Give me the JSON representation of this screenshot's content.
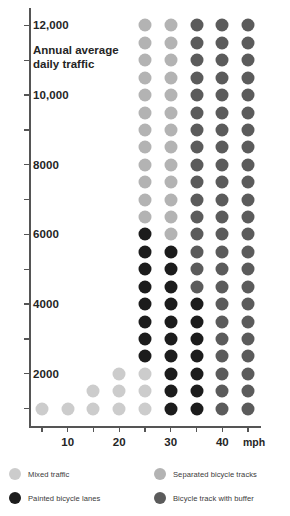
{
  "axis_title": "Annual average daily traffic",
  "x_unit_label": "mph",
  "y_axis": {
    "label": "Annual average daily traffic",
    "tick_values": [
      1000,
      2000,
      3000,
      4000,
      5000,
      6000,
      7000,
      8000,
      9000,
      10000,
      11000,
      12000
    ],
    "labeled_ticks": [
      {
        "value": 12000,
        "text": "12,000"
      },
      {
        "value": 10000,
        "text": "10,000"
      },
      {
        "value": 8000,
        "text": "8000"
      },
      {
        "value": 6000,
        "text": "6000"
      },
      {
        "value": 4000,
        "text": "4000"
      },
      {
        "value": 2000,
        "text": "2000"
      }
    ],
    "range": [
      500,
      12500
    ]
  },
  "x_axis": {
    "tick_values": [
      5,
      10,
      15,
      20,
      25,
      30,
      35,
      40,
      45
    ],
    "labeled_ticks": [
      {
        "value": 10,
        "text": "10"
      },
      {
        "value": 20,
        "text": "20"
      },
      {
        "value": 30,
        "text": "30"
      },
      {
        "value": 40,
        "text": "40"
      }
    ],
    "range": [
      2.5,
      47.5
    ]
  },
  "colors": {
    "mixed_traffic": "#cccccc",
    "separated_bicycle_tracks": "#b3b3b3",
    "bicycle_track_with_buffer": "#5b5b5b",
    "painted_bicycle_lanes": "#1c1c1c",
    "axis": "#555555",
    "text": "#252525"
  },
  "legend": {
    "items": [
      {
        "key": "mixed_traffic",
        "label": "Mixed traffic",
        "color": "#cccccc"
      },
      {
        "key": "painted_bicycle_lanes",
        "label": "Painted bicycle lanes",
        "color": "#1c1c1c"
      },
      {
        "key": "separated_bicycle_tracks",
        "label": "Separated bicycle tracks",
        "color": "#b3b3b3"
      },
      {
        "key": "bicycle_track_with_buffer",
        "label": "Bicycle track with buffer",
        "color": "#5b5b5b"
      }
    ]
  },
  "chart_data": {
    "type": "heatmap",
    "title": "Annual average daily traffic",
    "xlabel": "mph",
    "ylabel": "Annual average daily traffic",
    "xlim": [
      2.5,
      47.5
    ],
    "ylim": [
      500,
      12500
    ],
    "grid": false,
    "legend_position": "bottom",
    "x_categories": [
      5,
      10,
      15,
      20,
      25,
      30,
      35,
      40,
      45
    ],
    "y_categories": [
      1000,
      1500,
      2000,
      2500,
      3000,
      3500,
      4000,
      4500,
      5000,
      5500,
      6000,
      6500,
      7000,
      7500,
      8000,
      8500,
      9000,
      9500,
      10000,
      10500,
      11000,
      11500,
      12000
    ],
    "category_legend": [
      "mixed_traffic",
      "separated_bicycle_tracks",
      "bicycle_track_with_buffer",
      "painted_bicycle_lanes"
    ],
    "cells": [
      {
        "y": 12000,
        "row": [
          null,
          null,
          null,
          null,
          "separated_bicycle_tracks",
          "separated_bicycle_tracks",
          "bicycle_track_with_buffer",
          "bicycle_track_with_buffer",
          "bicycle_track_with_buffer"
        ]
      },
      {
        "y": 11500,
        "row": [
          null,
          null,
          null,
          null,
          "separated_bicycle_tracks",
          "separated_bicycle_tracks",
          "bicycle_track_with_buffer",
          "bicycle_track_with_buffer",
          "bicycle_track_with_buffer"
        ]
      },
      {
        "y": 11000,
        "row": [
          null,
          null,
          null,
          null,
          "separated_bicycle_tracks",
          "separated_bicycle_tracks",
          "bicycle_track_with_buffer",
          "bicycle_track_with_buffer",
          "bicycle_track_with_buffer"
        ]
      },
      {
        "y": 10500,
        "row": [
          null,
          null,
          null,
          null,
          "separated_bicycle_tracks",
          "separated_bicycle_tracks",
          "bicycle_track_with_buffer",
          "bicycle_track_with_buffer",
          "bicycle_track_with_buffer"
        ]
      },
      {
        "y": 10000,
        "row": [
          null,
          null,
          null,
          null,
          "separated_bicycle_tracks",
          "separated_bicycle_tracks",
          "bicycle_track_with_buffer",
          "bicycle_track_with_buffer",
          "bicycle_track_with_buffer"
        ]
      },
      {
        "y": 9500,
        "row": [
          null,
          null,
          null,
          null,
          "separated_bicycle_tracks",
          "separated_bicycle_tracks",
          "bicycle_track_with_buffer",
          "bicycle_track_with_buffer",
          "bicycle_track_with_buffer"
        ]
      },
      {
        "y": 9000,
        "row": [
          null,
          null,
          null,
          null,
          "separated_bicycle_tracks",
          "separated_bicycle_tracks",
          "bicycle_track_with_buffer",
          "bicycle_track_with_buffer",
          "bicycle_track_with_buffer"
        ]
      },
      {
        "y": 8500,
        "row": [
          null,
          null,
          null,
          null,
          "separated_bicycle_tracks",
          "separated_bicycle_tracks",
          "bicycle_track_with_buffer",
          "bicycle_track_with_buffer",
          "bicycle_track_with_buffer"
        ]
      },
      {
        "y": 8000,
        "row": [
          null,
          null,
          null,
          null,
          "separated_bicycle_tracks",
          "separated_bicycle_tracks",
          "bicycle_track_with_buffer",
          "bicycle_track_with_buffer",
          "bicycle_track_with_buffer"
        ]
      },
      {
        "y": 7500,
        "row": [
          null,
          null,
          null,
          null,
          "separated_bicycle_tracks",
          "separated_bicycle_tracks",
          "bicycle_track_with_buffer",
          "bicycle_track_with_buffer",
          "bicycle_track_with_buffer"
        ]
      },
      {
        "y": 7000,
        "row": [
          null,
          null,
          null,
          null,
          "separated_bicycle_tracks",
          "separated_bicycle_tracks",
          "bicycle_track_with_buffer",
          "bicycle_track_with_buffer",
          "bicycle_track_with_buffer"
        ]
      },
      {
        "y": 6500,
        "row": [
          null,
          null,
          null,
          null,
          "separated_bicycle_tracks",
          "separated_bicycle_tracks",
          "bicycle_track_with_buffer",
          "bicycle_track_with_buffer",
          "bicycle_track_with_buffer"
        ]
      },
      {
        "y": 6000,
        "row": [
          null,
          null,
          null,
          null,
          "painted_bicycle_lanes",
          "separated_bicycle_tracks",
          "bicycle_track_with_buffer",
          "bicycle_track_with_buffer",
          "bicycle_track_with_buffer"
        ]
      },
      {
        "y": 5500,
        "row": [
          null,
          null,
          null,
          null,
          "painted_bicycle_lanes",
          "painted_bicycle_lanes",
          "bicycle_track_with_buffer",
          "bicycle_track_with_buffer",
          "bicycle_track_with_buffer"
        ]
      },
      {
        "y": 5000,
        "row": [
          null,
          null,
          null,
          null,
          "painted_bicycle_lanes",
          "painted_bicycle_lanes",
          "bicycle_track_with_buffer",
          "bicycle_track_with_buffer",
          "bicycle_track_with_buffer"
        ]
      },
      {
        "y": 4500,
        "row": [
          null,
          null,
          null,
          null,
          "painted_bicycle_lanes",
          "painted_bicycle_lanes",
          "bicycle_track_with_buffer",
          "bicycle_track_with_buffer",
          "bicycle_track_with_buffer"
        ]
      },
      {
        "y": 4000,
        "row": [
          null,
          null,
          null,
          null,
          "painted_bicycle_lanes",
          "painted_bicycle_lanes",
          "painted_bicycle_lanes",
          "bicycle_track_with_buffer",
          "bicycle_track_with_buffer"
        ]
      },
      {
        "y": 3500,
        "row": [
          null,
          null,
          null,
          null,
          "painted_bicycle_lanes",
          "painted_bicycle_lanes",
          "painted_bicycle_lanes",
          "bicycle_track_with_buffer",
          "bicycle_track_with_buffer"
        ]
      },
      {
        "y": 3000,
        "row": [
          null,
          null,
          null,
          null,
          "painted_bicycle_lanes",
          "painted_bicycle_lanes",
          "painted_bicycle_lanes",
          "bicycle_track_with_buffer",
          "bicycle_track_with_buffer"
        ]
      },
      {
        "y": 2500,
        "row": [
          null,
          null,
          null,
          null,
          "painted_bicycle_lanes",
          "painted_bicycle_lanes",
          "painted_bicycle_lanes",
          "bicycle_track_with_buffer",
          "bicycle_track_with_buffer"
        ]
      },
      {
        "y": 2000,
        "row": [
          null,
          null,
          null,
          "mixed_traffic",
          "mixed_traffic",
          "painted_bicycle_lanes",
          "painted_bicycle_lanes",
          "bicycle_track_with_buffer",
          "bicycle_track_with_buffer"
        ]
      },
      {
        "y": 1500,
        "row": [
          null,
          null,
          "mixed_traffic",
          "mixed_traffic",
          "mixed_traffic",
          "painted_bicycle_lanes",
          "painted_bicycle_lanes",
          "bicycle_track_with_buffer",
          "bicycle_track_with_buffer"
        ]
      },
      {
        "y": 1000,
        "row": [
          "mixed_traffic",
          "mixed_traffic",
          "mixed_traffic",
          "mixed_traffic",
          "mixed_traffic",
          "painted_bicycle_lanes",
          "painted_bicycle_lanes",
          "bicycle_track_with_buffer",
          "bicycle_track_with_buffer"
        ]
      }
    ]
  }
}
